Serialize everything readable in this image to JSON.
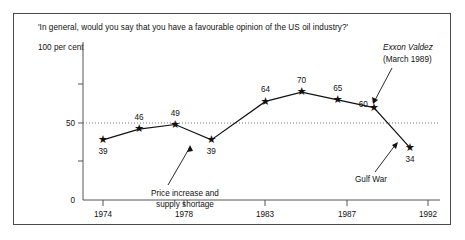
{
  "chart_data": {
    "type": "line",
    "title": "'In general, would you say that you have a favourable opinion of the US oil industry?'",
    "ylabel": "100 per cent",
    "xlabel": "",
    "ylim": [
      0,
      100
    ],
    "xlim": [
      1974,
      1992
    ],
    "grid": "dotted horizontal line at 50",
    "legend": "none",
    "x": [
      1974,
      1976,
      1978,
      1980,
      1983,
      1985,
      1987,
      1989,
      1991
    ],
    "values": [
      39,
      46,
      49,
      39,
      64,
      70,
      65,
      60,
      34
    ],
    "point_labels": [
      "39",
      "46",
      "49",
      "39",
      "64",
      "70",
      "65",
      "60",
      "34"
    ],
    "ytick_labels": [
      "0",
      "50"
    ],
    "ytick_values": [
      0,
      50
    ],
    "xtick_labels": [
      "1974",
      "1978",
      "1983",
      "1987",
      "1992"
    ],
    "xtick_values": [
      1974,
      1978,
      1983,
      1987,
      1992
    ],
    "marker": "star",
    "annotations": [
      {
        "name": "price-increase",
        "line1": "Price increase and",
        "line2": "supply shortage",
        "style": "regular"
      },
      {
        "name": "exxon-valdez",
        "line1": "Exxon Valdez",
        "line2": "(March 1989)",
        "style": "italic-first-line"
      },
      {
        "name": "gulf-war",
        "line1": "Gulf War",
        "line2": "",
        "style": "regular"
      }
    ]
  }
}
